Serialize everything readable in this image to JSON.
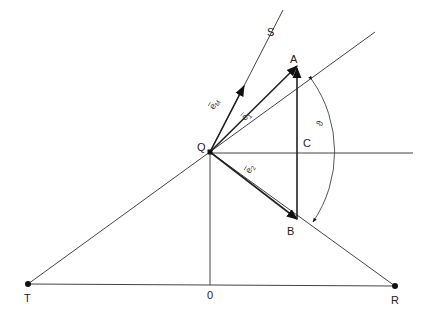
{
  "diagram": {
    "title": "",
    "points": {
      "T": {
        "label": "T",
        "x": 28,
        "y": 284
      },
      "O": {
        "label": "0",
        "x": 210,
        "y": 285
      },
      "R": {
        "label": "R",
        "x": 395,
        "y": 286
      },
      "Q": {
        "label": "Q",
        "x": 210,
        "y": 152
      },
      "A": {
        "label": "A",
        "x": 297,
        "y": 66
      },
      "B": {
        "label": "B",
        "x": 297,
        "y": 219
      },
      "C": {
        "label": "C",
        "x": 297,
        "y": 153
      },
      "S": {
        "label": "S",
        "x": 283,
        "y": 10
      }
    },
    "vectors": {
      "eM": {
        "base": "e",
        "sub": "M",
        "label": "ē_M"
      },
      "e1": {
        "base": "e",
        "sub": "1",
        "label": "ē_1"
      },
      "e2": {
        "base": "e",
        "sub": "2",
        "label": "ē_2"
      }
    },
    "angle": {
      "label": "ϑ"
    },
    "colors": {
      "line": "#333333",
      "point": "#111111",
      "background": "#ffffff"
    }
  }
}
